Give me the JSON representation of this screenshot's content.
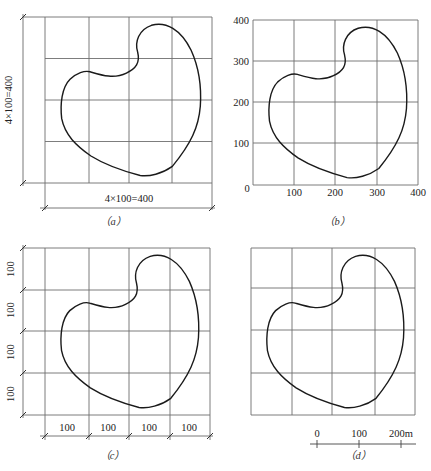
{
  "figure": {
    "panels": [
      {
        "id": "a",
        "caption": "（a）",
        "grid": {
          "cols": 4,
          "rows": 4
        },
        "dimension_labels": {
          "vertical": "4×100=400",
          "horizontal": "4×100=400"
        }
      },
      {
        "id": "b",
        "caption": "（b）",
        "grid": {
          "cols": 4,
          "rows": 4
        },
        "x_ticks": [
          "0",
          "100",
          "200",
          "300",
          "400"
        ],
        "y_ticks": [
          "400",
          "300",
          "200",
          "100"
        ]
      },
      {
        "id": "c",
        "caption": "（c）",
        "grid": {
          "cols": 4,
          "rows": 4
        },
        "x_segment_labels": [
          "100",
          "100",
          "100",
          "100"
        ],
        "y_segment_labels": [
          "100",
          "100",
          "100",
          "100"
        ]
      },
      {
        "id": "d",
        "caption": "（d）",
        "grid": {
          "cols": 4,
          "rows": 4
        },
        "scale_bar_labels": [
          "0",
          "100",
          "200m"
        ]
      }
    ],
    "shape_outline_units": "400 x 400 grid, 100 per cell"
  }
}
